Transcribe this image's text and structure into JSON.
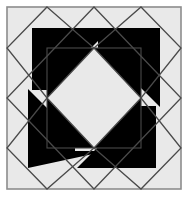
{
  "figure": {
    "type": "geometric-quilt-block",
    "canvas": {
      "width": 188,
      "height": 199
    },
    "background_color": "#ffffff"
  },
  "palette": {
    "page_background": "#ffffff",
    "block_background": "#e9e9e9",
    "dark_fill": "#000000",
    "outline_stroke": "#4a4a4a",
    "frame_stroke": "#8c8c8c",
    "light_patch": "#e9e9e9"
  },
  "geometry": {
    "frame": {
      "x": 7,
      "y": 7,
      "width": 174,
      "height": 182,
      "stroke_width": 1.6
    },
    "edge_midpoints": {
      "top": [
        94,
        7
      ],
      "right": [
        181,
        98
      ],
      "bottom": [
        94,
        189
      ],
      "left": [
        7,
        98
      ]
    },
    "inner_square": {
      "x": 47,
      "y": 48,
      "width": 94,
      "height": 100
    },
    "inner_square_center": [
      94,
      98
    ],
    "outline_stroke_width": 1.3
  },
  "shapes": {
    "big_diamond": {
      "name": "large-diamond-outline",
      "points": "94,7 181,98 94,189 7,98",
      "fill": "none"
    },
    "corner_diamonds": [
      {
        "name": "corner-diamond-top-left",
        "points": "47,7 94,48 47,98 7,48"
      },
      {
        "name": "corner-diamond-top-right",
        "points": "141,7 181,48 141,98 94,48"
      },
      {
        "name": "corner-diamond-bottom-left",
        "points": "47,98 94,148 47,189 7,148"
      },
      {
        "name": "corner-diamond-bottom-right",
        "points": "141,98 181,148 141,189 94,148"
      }
    ],
    "corner_black_flags": [
      {
        "name": "black-flag-top-left",
        "points": "32,28 111,28 79,60 64,60 64,90 32,90"
      },
      {
        "name": "black-flag-top-right",
        "points": "160,28 160,107 128,75 128,60 98,60 98,28"
      },
      {
        "name": "black-flag-bottom-left",
        "points": "28,168 28,89 60,121 75,121 75,151 107,151"
      },
      {
        "name": "black-flag-bottom-right",
        "points": "156,168 77,168 109,136 124,136 124,106 156,106"
      }
    ],
    "inner_pinwheel_triangles": [
      {
        "name": "inner-triangle-top-left",
        "points": "47,48 141,48 94,98"
      },
      {
        "name": "inner-triangle-top-right",
        "points": "141,48 141,148 94,98"
      },
      {
        "name": "inner-triangle-bottom-right",
        "points": "141,148 47,148 94,98"
      },
      {
        "name": "inner-triangle-bottom-left",
        "points": "47,148 47,48 94,98"
      }
    ],
    "inner_light_diamond": {
      "name": "inner-light-diamond",
      "points": "94,48 141,98 94,148 47,98"
    }
  },
  "labels": {
    "alt_text": "Black and white geometric quilt block with a central light diamond inside a black square, surrounded by four rotational black flag shapes and overlapping diamond outlines."
  }
}
